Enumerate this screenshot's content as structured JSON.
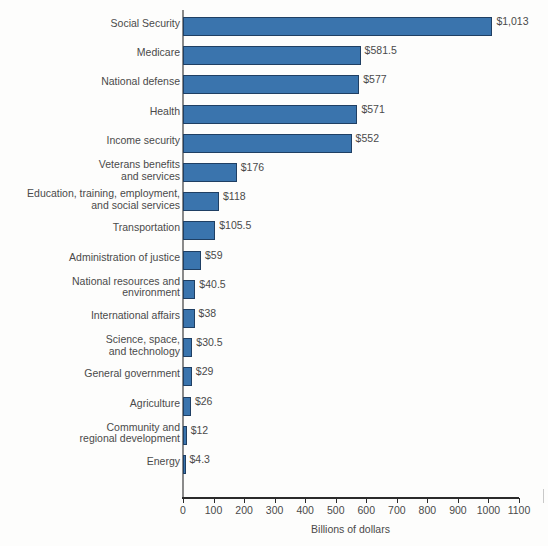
{
  "chart_data": {
    "type": "bar",
    "orientation": "horizontal",
    "title": "",
    "xlabel": "Billions of dollars",
    "ylabel": "",
    "xlim": [
      0,
      1100
    ],
    "xticks": [
      0,
      100,
      200,
      300,
      400,
      500,
      600,
      700,
      800,
      900,
      1000,
      1100
    ],
    "xtick_labels": [
      "0",
      "100",
      "200",
      "300",
      "400",
      "500",
      "600",
      "700",
      "800",
      "900",
      "1000",
      "1100"
    ],
    "grid": false,
    "legend": false,
    "bar_color": "#3a74ad",
    "bar_edge_color": "#1f3f63",
    "text_color": "#4a4a4a",
    "categories": [
      "Social Security",
      "Medicare",
      "National defense",
      "Health",
      "Income security",
      "Veterans benefits\nand services",
      "Education, training, employment,\nand social services",
      "Transportation",
      "Administration of justice",
      "National resources and\nenvironment",
      "International affairs",
      "Science, space,\nand technology",
      "General government",
      "Agriculture",
      "Community and\nregional development",
      "Energy"
    ],
    "values": [
      1013,
      581.5,
      577,
      571,
      552,
      176,
      118,
      105.5,
      59,
      40.5,
      38,
      30.5,
      29,
      26,
      12,
      4.3
    ],
    "value_labels": [
      "$1,013",
      "$581.5",
      "$577",
      "$571",
      "$552",
      "$176",
      "$118",
      "$105.5",
      "$59",
      "$40.5",
      "$38",
      "$30.5",
      "$29",
      "$26",
      "$12",
      "$4.3"
    ]
  }
}
